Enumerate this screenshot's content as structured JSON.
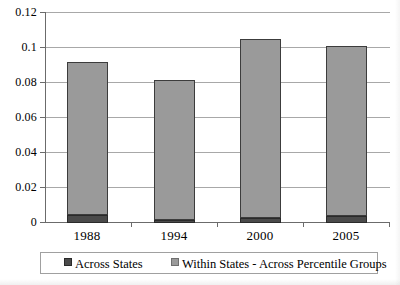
{
  "chart_data": {
    "type": "bar",
    "subtype": "stacked-column",
    "title": "",
    "xlabel": "",
    "ylabel": "",
    "categories": [
      "1988",
      "1994",
      "2000",
      "2005"
    ],
    "series": [
      {
        "name": "Across States",
        "color": "#4a4a4a",
        "values": [
          0.0045,
          0.002,
          0.003,
          0.004
        ]
      },
      {
        "name": "Within States - Across Percentile Groups",
        "color": "#9a9a9a",
        "values": [
          0.0875,
          0.0795,
          0.102,
          0.097
        ]
      }
    ],
    "totals": [
      0.092,
      0.0815,
      0.105,
      0.101
    ],
    "ylim": [
      0,
      0.12
    ],
    "ytick_labels": [
      "0",
      "0.02",
      "0.04",
      "0.06",
      "0.08",
      "0.1",
      "0.12"
    ],
    "ytick_values": [
      0,
      0.02,
      0.04,
      0.06,
      0.08,
      0.1,
      0.12
    ],
    "grid": true,
    "legend_position": "bottom"
  },
  "legend": {
    "items": [
      {
        "label": "Across States",
        "swatch": "dark-square-swatch"
      },
      {
        "label": "Within States - Across Percentile Groups",
        "swatch": "light-square-swatch"
      }
    ]
  }
}
